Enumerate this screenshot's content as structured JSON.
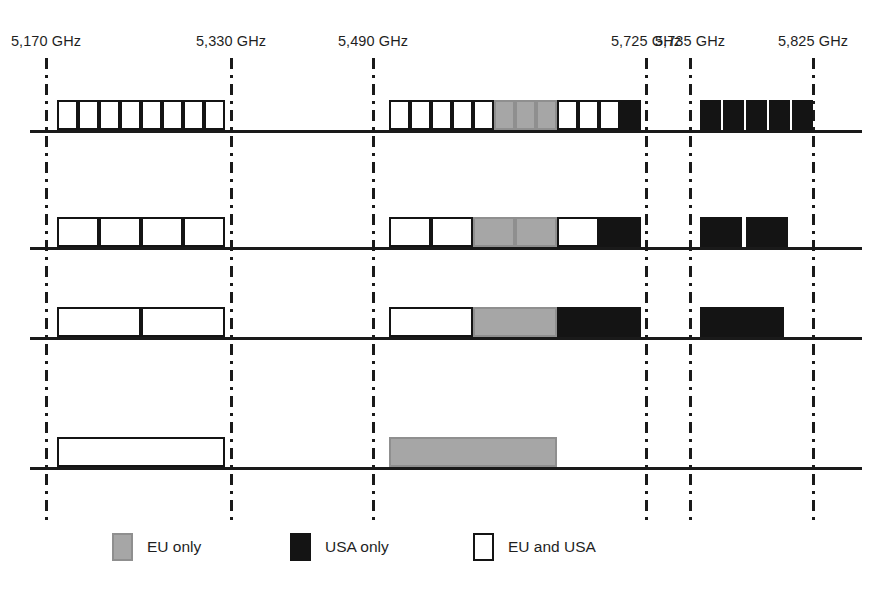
{
  "chart_data": {
    "type": "bar",
    "title": "",
    "xlabel": "",
    "ylabel": "",
    "grid": false,
    "legend_position": "bottom",
    "axis_unit": "GHz",
    "frequency_markers": [
      {
        "label": "5,170 GHz",
        "value": 5170,
        "x": 46
      },
      {
        "label": "5,330 GHz",
        "value": 5330,
        "x": 231
      },
      {
        "label": "5,490 GHz",
        "value": 5490,
        "x": 373
      },
      {
        "label": "5,725 GHz",
        "value": 5725,
        "x": 646
      },
      {
        "label": "5,735 GHz",
        "value": 5735,
        "x": 690
      },
      {
        "label": "5,825 GHz",
        "value": 5825,
        "x": 813
      }
    ],
    "colors": {
      "eu_only": "#a6a6a6",
      "usa_only": "#141414",
      "eu_and_usa": "#ffffff",
      "line": "#1a1a1a"
    },
    "legend": [
      {
        "key": "eu_only",
        "label": "EU only",
        "swatch": "gray",
        "x": 112
      },
      {
        "key": "usa_only",
        "label": "USA only",
        "swatch": "black",
        "x": 290
      },
      {
        "key": "eu_and_usa",
        "label": "EU and USA",
        "swatch": "white",
        "x": 473
      }
    ],
    "rows": [
      {
        "name": "20 MHz channels",
        "baseline_y": 130,
        "block_height": 30,
        "channels": [
          {
            "type": "white",
            "x": 57,
            "w": 21
          },
          {
            "type": "white",
            "x": 78,
            "w": 21
          },
          {
            "type": "white",
            "x": 99,
            "w": 21
          },
          {
            "type": "white",
            "x": 120,
            "w": 21
          },
          {
            "type": "white",
            "x": 141,
            "w": 21
          },
          {
            "type": "white",
            "x": 162,
            "w": 21
          },
          {
            "type": "white",
            "x": 183,
            "w": 21
          },
          {
            "type": "white",
            "x": 204,
            "w": 21
          },
          {
            "type": "white",
            "x": 389,
            "w": 21
          },
          {
            "type": "white",
            "x": 410,
            "w": 21
          },
          {
            "type": "white",
            "x": 431,
            "w": 21
          },
          {
            "type": "white",
            "x": 452,
            "w": 21
          },
          {
            "type": "white",
            "x": 473,
            "w": 21
          },
          {
            "type": "gray",
            "x": 494,
            "w": 21
          },
          {
            "type": "gray",
            "x": 515,
            "w": 21
          },
          {
            "type": "gray",
            "x": 536,
            "w": 21
          },
          {
            "type": "white",
            "x": 557,
            "w": 21
          },
          {
            "type": "white",
            "x": 578,
            "w": 21
          },
          {
            "type": "white",
            "x": 599,
            "w": 21
          },
          {
            "type": "black",
            "x": 620,
            "w": 21
          },
          {
            "type": "black",
            "x": 700,
            "w": 21
          },
          {
            "type": "black",
            "x": 723,
            "w": 21
          },
          {
            "type": "black",
            "x": 746,
            "w": 21
          },
          {
            "type": "black",
            "x": 769,
            "w": 21
          },
          {
            "type": "black",
            "x": 792,
            "w": 21
          }
        ]
      },
      {
        "name": "40 MHz channels",
        "baseline_y": 247,
        "block_height": 30,
        "channels": [
          {
            "type": "white",
            "x": 57,
            "w": 42
          },
          {
            "type": "white",
            "x": 99,
            "w": 42
          },
          {
            "type": "white",
            "x": 141,
            "w": 42
          },
          {
            "type": "white",
            "x": 183,
            "w": 42
          },
          {
            "type": "white",
            "x": 389,
            "w": 42
          },
          {
            "type": "white",
            "x": 431,
            "w": 42
          },
          {
            "type": "gray",
            "x": 473,
            "w": 42
          },
          {
            "type": "gray",
            "x": 515,
            "w": 42
          },
          {
            "type": "white",
            "x": 557,
            "w": 42
          },
          {
            "type": "black",
            "x": 599,
            "w": 42
          },
          {
            "type": "black",
            "x": 700,
            "w": 42
          },
          {
            "type": "black",
            "x": 746,
            "w": 42
          }
        ]
      },
      {
        "name": "80 MHz channels",
        "baseline_y": 337,
        "block_height": 30,
        "channels": [
          {
            "type": "white",
            "x": 57,
            "w": 84
          },
          {
            "type": "white",
            "x": 141,
            "w": 84
          },
          {
            "type": "white",
            "x": 389,
            "w": 84
          },
          {
            "type": "gray",
            "x": 473,
            "w": 84
          },
          {
            "type": "black",
            "x": 557,
            "w": 84
          },
          {
            "type": "black",
            "x": 700,
            "w": 84
          }
        ]
      },
      {
        "name": "160 MHz channels",
        "baseline_y": 467,
        "block_height": 30,
        "channels": [
          {
            "type": "white",
            "x": 57,
            "w": 168
          },
          {
            "type": "gray",
            "x": 389,
            "w": 168
          }
        ]
      }
    ]
  }
}
